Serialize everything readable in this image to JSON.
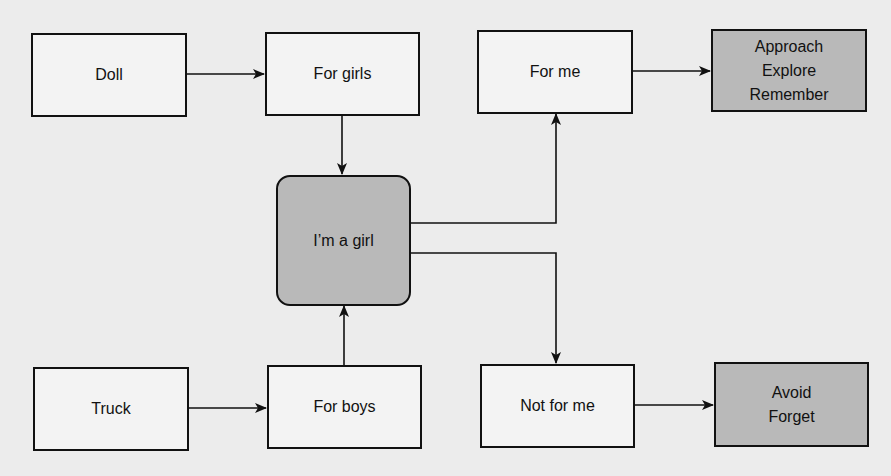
{
  "diagram": {
    "colors": {
      "background": "#ececec",
      "box_fill": "#f3f3f3",
      "shaded_fill": "#b9b9b9",
      "stroke": "#111111"
    },
    "nodes": {
      "doll": {
        "label": "Doll"
      },
      "for_girls": {
        "label": "For girls"
      },
      "im_a_girl": {
        "label": "I’m a girl"
      },
      "for_me": {
        "label": "For me"
      },
      "approach": {
        "lines": [
          "Approach",
          "Explore",
          "Remember"
        ]
      },
      "truck": {
        "label": "Truck"
      },
      "for_boys": {
        "label": "For boys"
      },
      "not_for_me": {
        "label": "Not for me"
      },
      "avoid": {
        "lines": [
          "Avoid",
          "Forget"
        ]
      }
    },
    "edges": [
      {
        "from": "Doll",
        "to": "For girls"
      },
      {
        "from": "For girls",
        "to": "I’m a girl"
      },
      {
        "from": "Truck",
        "to": "For boys"
      },
      {
        "from": "For boys",
        "to": "I’m a girl"
      },
      {
        "from": "I’m a girl",
        "to": "For me"
      },
      {
        "from": "I’m a girl",
        "to": "Not for me"
      },
      {
        "from": "For me",
        "to": "Approach / Explore / Remember"
      },
      {
        "from": "Not for me",
        "to": "Avoid / Forget"
      }
    ]
  }
}
